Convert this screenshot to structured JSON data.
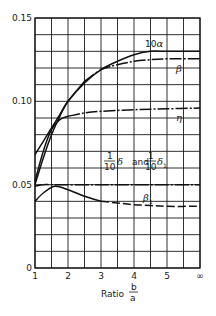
{
  "chart_data": {
    "type": "line",
    "title": "",
    "xlabel": "Ratio b/a",
    "xlabel_parts": {
      "prefix": "Ratio",
      "num": "b",
      "den": "a"
    },
    "ylabel": "",
    "x_ticks": [
      "1",
      "2",
      "3",
      "4",
      "5",
      "∞"
    ],
    "y_ticks": [
      "0",
      "0.05",
      "0.10",
      "0.15"
    ],
    "xlim": [
      1,
      6
    ],
    "ylim": [
      0,
      0.15
    ],
    "grid": true,
    "x_minor_step": 0.5,
    "y_minor_step": 0.01,
    "note": "x = 6 represents b/a = ∞",
    "series": [
      {
        "name": "10α",
        "label": "10α",
        "style": "solid",
        "x": [
          1,
          1.25,
          1.5,
          1.75,
          2,
          2.5,
          3,
          3.5,
          4,
          4.5,
          5,
          6
        ],
        "y": [
          0.068,
          0.076,
          0.084,
          0.092,
          0.1,
          0.111,
          0.119,
          0.124,
          0.128,
          0.13,
          0.13,
          0.13
        ]
      },
      {
        "name": "β",
        "label": "β",
        "style": "dashdot-tail",
        "x": [
          1,
          1.25,
          1.5,
          1.75,
          2,
          2.5,
          3,
          3.5,
          4,
          4.5,
          5,
          6
        ],
        "y": [
          0.05,
          0.066,
          0.08,
          0.091,
          0.1,
          0.112,
          0.119,
          0.122,
          0.124,
          0.125,
          0.1255,
          0.1255
        ]
      },
      {
        "name": "η",
        "label": "η",
        "style": "dashdot-tail",
        "x": [
          1,
          1.25,
          1.5,
          1.75,
          2,
          2.5,
          3,
          4,
          5,
          6
        ],
        "y": [
          0.052,
          0.07,
          0.083,
          0.089,
          0.091,
          0.093,
          0.094,
          0.095,
          0.0955,
          0.096
        ]
      },
      {
        "name": "δ/10 and δ₁/10",
        "label": "1/10 δ and 1/10 δ₁",
        "style": "dashdot",
        "x": [
          1,
          1.25,
          1.5,
          2,
          3,
          4,
          5,
          6
        ],
        "y": [
          0.049,
          0.05,
          0.05,
          0.05,
          0.05,
          0.05,
          0.05,
          0.05
        ]
      },
      {
        "name": "β₁",
        "label": "β₁",
        "style": "solid-then-dashed",
        "x": [
          1,
          1.25,
          1.6,
          2,
          2.5,
          3,
          3.5,
          4,
          4.5,
          5,
          6
        ],
        "y": [
          0.04,
          0.045,
          0.049,
          0.047,
          0.043,
          0.04,
          0.039,
          0.038,
          0.0375,
          0.037,
          0.037
        ]
      }
    ],
    "annotations": [
      {
        "text": "10α",
        "x": 4.3,
        "y": 0.132
      },
      {
        "text": "β",
        "x": 5.4,
        "y": 0.121
      },
      {
        "text": "η",
        "x": 5.4,
        "y": 0.09
      },
      {
        "text": "1/10 δ and 1/10 δ₁",
        "x": 3.4,
        "y": 0.054
      },
      {
        "text": "β₁",
        "x": 4.3,
        "y": 0.042
      }
    ],
    "legend": "none (curves labeled inline)"
  },
  "labels": {
    "alpha": "10",
    "alpha_sym": "α",
    "beta": "β",
    "eta": "η",
    "beta1": "β",
    "beta1_sub": "1",
    "delta_frac_num": "1",
    "delta_frac_den": "10",
    "delta_sym": "δ",
    "and_text": "and",
    "delta1_sym": "δ",
    "delta1_sub": "1"
  }
}
